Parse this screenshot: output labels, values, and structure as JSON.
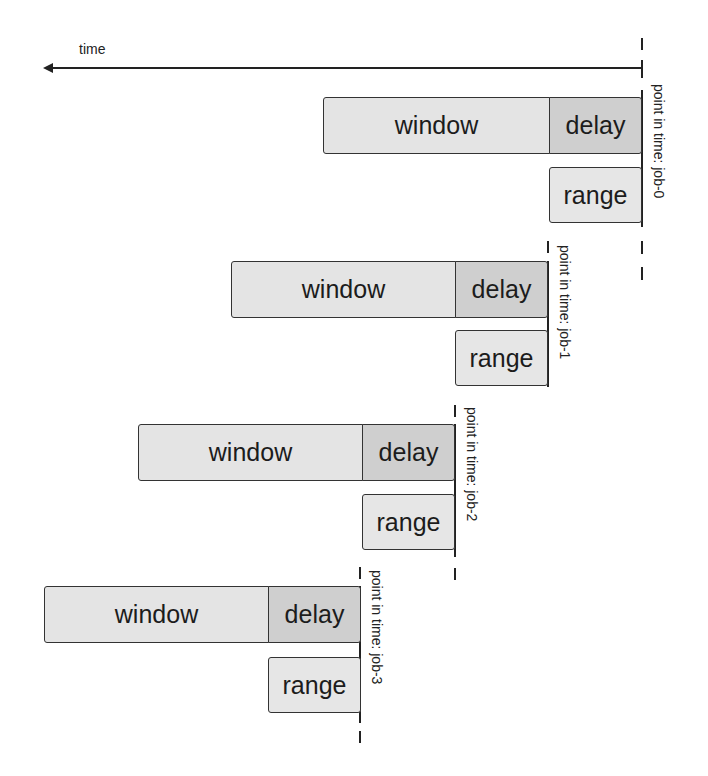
{
  "diagram": {
    "axis": {
      "label": "time",
      "direction": "right-to-left"
    },
    "box_labels": {
      "window": "window",
      "delay": "delay",
      "range": "range"
    },
    "colors": {
      "window": "#e4e4e4",
      "delay": "#cfcfcf",
      "range": "#e6e6e6",
      "stroke": "#333333"
    },
    "jobs": [
      {
        "id": "job-0",
        "label": "point in time: job-0",
        "window": "window",
        "delay": "delay",
        "range": "range"
      },
      {
        "id": "job-1",
        "label": "point in time: job-1",
        "window": "window",
        "delay": "delay",
        "range": "range"
      },
      {
        "id": "job-2",
        "label": "point in time: job-2",
        "window": "window",
        "delay": "delay",
        "range": "range"
      },
      {
        "id": "job-3",
        "label": "point in time: job-3",
        "window": "window",
        "delay": "delay",
        "range": "range"
      }
    ]
  }
}
